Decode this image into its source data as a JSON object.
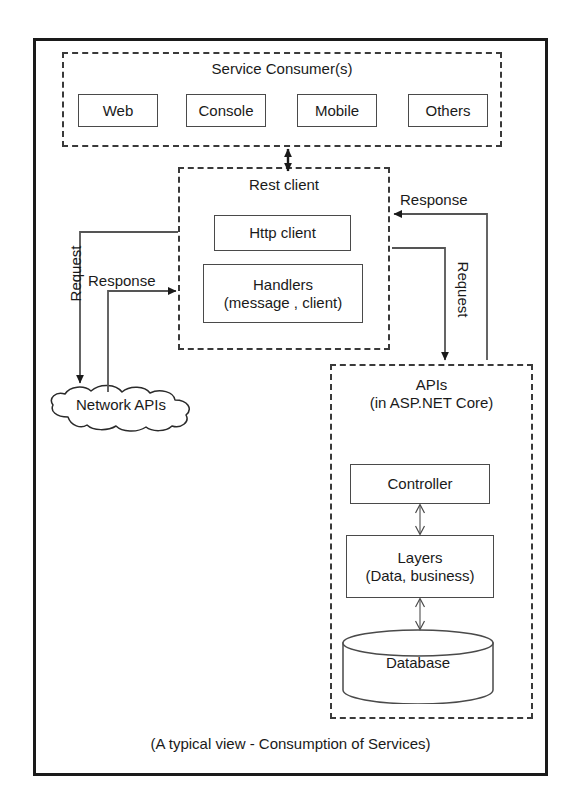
{
  "diagram": {
    "caption": "(A typical view - Consumption of Services)",
    "frame_color": "#1a1a1a",
    "box_border_color": "#4a4a4a",
    "dashed_border_color": "#3a3a3a",
    "background": "#ffffff"
  },
  "consumer": {
    "title": "Service Consumer(s)",
    "boxes": [
      {
        "label": "Web"
      },
      {
        "label": "Console"
      },
      {
        "label": "Mobile"
      },
      {
        "label": "Others"
      }
    ]
  },
  "rest_client": {
    "title": "Rest client",
    "http_client": "Http client",
    "handlers": "Handlers\n(message , client)"
  },
  "apis": {
    "title": "APIs\n(in ASP.NET Core)",
    "controller": "Controller",
    "layers": "Layers\n(Data, business)",
    "database": "Database"
  },
  "network": {
    "cloud_label": "Network APIs"
  },
  "connectors": {
    "request_left": "Request",
    "response_left": "Response",
    "response_right": "Response",
    "request_right": "Request"
  }
}
